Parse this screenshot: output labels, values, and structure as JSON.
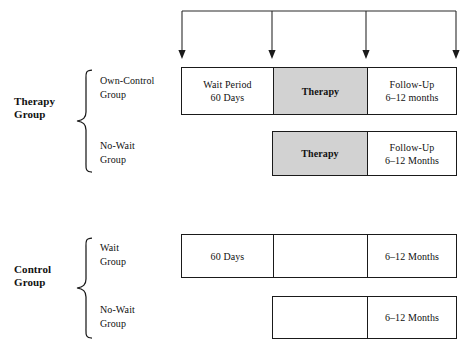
{
  "figure": {
    "top_caption": "",
    "shaded_color": "#d2d2d2",
    "line_color": "#1a1a1a"
  },
  "timeline": {
    "name": "assessment-timeline",
    "arrow_count": 4,
    "arrow_labels": [
      "assessment-1",
      "assessment-2",
      "assessment-3",
      "assessment-4"
    ]
  },
  "groups": [
    {
      "key": "therapy",
      "label_line1": "Therapy",
      "label_line2": "Group",
      "arms": [
        {
          "key": "own-control",
          "label_line1": "Own-Control",
          "label_line2": "Group",
          "cells": [
            {
              "key": "wait-period",
              "shaded": false,
              "line1": "Wait Period",
              "line2": "60 Days"
            },
            {
              "key": "therapy",
              "shaded": true,
              "line1": "Therapy",
              "line2": ""
            },
            {
              "key": "follow-up",
              "shaded": false,
              "line1": "Follow-Up",
              "line2": "6–12 months"
            }
          ]
        },
        {
          "key": "no-wait",
          "label_line1": "No-Wait",
          "label_line2": "Group",
          "cells": [
            {
              "key": "therapy",
              "shaded": true,
              "line1": "Therapy",
              "line2": ""
            },
            {
              "key": "follow-up",
              "shaded": false,
              "line1": "Follow-Up",
              "line2": "6–12 Months"
            }
          ]
        }
      ]
    },
    {
      "key": "control",
      "label_line1": "Control",
      "label_line2": "Group",
      "arms": [
        {
          "key": "wait",
          "label_line1": "Wait",
          "label_line2": "Group",
          "cells": [
            {
              "key": "wait-period",
              "shaded": false,
              "line1": "60 Days",
              "line2": ""
            },
            {
              "key": "no-treatment",
              "shaded": false,
              "line1": "",
              "line2": ""
            },
            {
              "key": "follow-up",
              "shaded": false,
              "line1": "6–12 Months",
              "line2": ""
            }
          ]
        },
        {
          "key": "no-wait",
          "label_line1": "No-Wait",
          "label_line2": "Group",
          "cells": [
            {
              "key": "no-treatment",
              "shaded": false,
              "line1": "",
              "line2": ""
            },
            {
              "key": "follow-up",
              "shaded": false,
              "line1": "6–12 Months",
              "line2": ""
            }
          ]
        }
      ]
    }
  ]
}
